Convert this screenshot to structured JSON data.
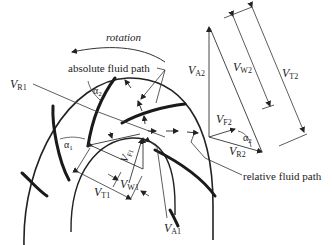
{
  "diagram": {
    "labels": {
      "rotation": "rotation",
      "absolute_path": "absolute fluid path",
      "relative_path": "relative fluid path",
      "VR1_V": "V",
      "VR1_sub": "R1",
      "VA2_V": "V",
      "VA2_sub": "A2",
      "VW2_V": "V",
      "VW2_sub": "W2",
      "VT2_V": "V",
      "VT2_sub": "T2",
      "VF2_V": "V",
      "VF2_sub": "F2",
      "VR2_V": "V",
      "VR2_sub": "R2",
      "VF1_V": "V",
      "VF1_sub": "F1",
      "VW1_V": "V",
      "VW1_sub": "W1",
      "VT1_V": "V",
      "VT1_sub": "T1",
      "VA1_V": "V",
      "VA1_sub": "A1",
      "alpha1": "α",
      "alpha1_sub": "1",
      "alpha2_top": "α",
      "alpha2_top_sub": "2",
      "alpha2_right": "α",
      "alpha2_right_sub": "2"
    },
    "colors": {
      "line": "#333333",
      "blade": "#1a1a1a",
      "thin": "#555555"
    }
  }
}
